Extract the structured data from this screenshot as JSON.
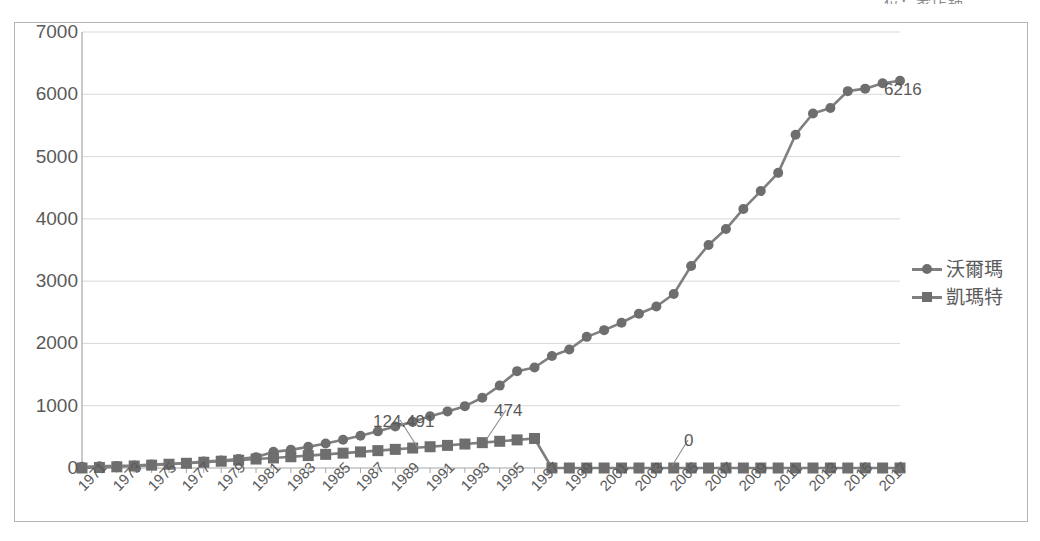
{
  "clipped_title": "位：家店鋪",
  "legend": {
    "position": "right-middle",
    "items": [
      {
        "label": "沃爾瑪",
        "marker": "circle-marker-icon",
        "color": "#6e6e6e"
      },
      {
        "label": "凱瑪特",
        "marker": "square-marker-icon",
        "color": "#6e6e6e"
      }
    ]
  },
  "annotations": [
    {
      "name": "kmart-1991-label",
      "text": "124.491",
      "x": 373,
      "y": 412
    },
    {
      "name": "kmart-peak-label",
      "text": "474",
      "x": 494,
      "y": 401
    },
    {
      "name": "kmart-zero-label",
      "text": "0",
      "x": 684,
      "y": 431
    },
    {
      "name": "walmart-final-label",
      "text": "6216",
      "x": 884,
      "y": 80
    }
  ],
  "chart_data": {
    "type": "line",
    "title": "",
    "subtitle": "",
    "xlabel": "",
    "ylabel": "",
    "ylim": [
      0,
      7000
    ],
    "ytick_step": 1000,
    "yticks": [
      "0",
      "1000",
      "2000",
      "3000",
      "4000",
      "5000",
      "6000",
      "7000"
    ],
    "grid": true,
    "grid_axis": "y",
    "legend_position": "right",
    "x": [
      1971,
      1972,
      1973,
      1974,
      1975,
      1976,
      1977,
      1978,
      1979,
      1980,
      1981,
      1982,
      1983,
      1984,
      1985,
      1986,
      1987,
      1988,
      1989,
      1990,
      1991,
      1992,
      1993,
      1994,
      1995,
      1996,
      1997,
      1998,
      1999,
      2000,
      2001,
      2002,
      2003,
      2004,
      2005,
      2006,
      2007,
      2008,
      2009,
      2010,
      2011,
      2012,
      2013,
      2014,
      2015,
      2016,
      2017,
      2018
    ],
    "xtick_labels": [
      "1971",
      "1973",
      "1975",
      "1977",
      "1979",
      "1981",
      "1983",
      "1985",
      "1987",
      "1989",
      "1991",
      "1993",
      "1995",
      "1997",
      "1999",
      "2001",
      "2003",
      "2005",
      "2007",
      "2009",
      "2011",
      "2013",
      "2015",
      "2017"
    ],
    "series": [
      {
        "name": "沃爾瑪",
        "marker": "circle",
        "color": "#6e6e6e",
        "values": [
          38,
          51,
          64,
          78,
          104,
          125,
          153,
          195,
          229,
          276,
          330,
          491,
          642,
          745,
          859,
          980,
          1114,
          1259,
          1402,
          1573,
          1720,
          1880,
          2136,
          2504,
          2943,
          3054,
          3406,
          3599,
          3985,
          4189,
          4414,
          4688,
          4906,
          5289,
          6141,
          6779,
          7262,
          7873,
          8416,
          8970,
          10130,
          10773,
          10942,
          11453,
          11528,
          11528,
          11695,
          11766
        ]
      },
      {
        "name": "凱瑪特",
        "marker": "square",
        "color": "#6e6e6e",
        "values": [
          0,
          0,
          0,
          0,
          0,
          0,
          0,
          0,
          0,
          0,
          0,
          0,
          0,
          0,
          0,
          0,
          0,
          0,
          0,
          0,
          124.491,
          0,
          0,
          0,
          0,
          0,
          474,
          0,
          0,
          0,
          0,
          0,
          0,
          0,
          0,
          0,
          0,
          0,
          0,
          0,
          0,
          0,
          0,
          0,
          0,
          0,
          0,
          0
        ]
      }
    ],
    "plotted_walmart": [
      38,
      51,
      64,
      78,
      104,
      125,
      153,
      195,
      229,
      276,
      330,
      491,
      551,
      642,
      745,
      859,
      980,
      1114,
      1259,
      1402,
      1573,
      1720,
      1880,
      2136,
      2504,
      2943,
      3054,
      3406,
      3599,
      3985,
      4189,
      4414,
      4688,
      4906,
      5289,
      6141,
      6779,
      7262,
      7873,
      8416,
      8970,
      10130,
      10773,
      10942,
      11453,
      11528,
      11695,
      11766
    ]
  }
}
